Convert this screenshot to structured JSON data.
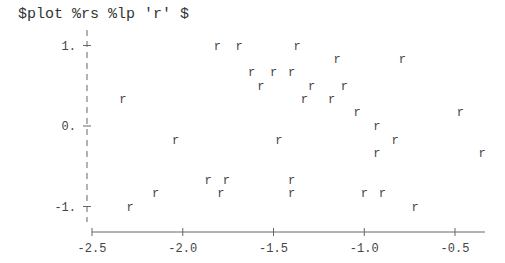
{
  "command": "$plot %rs %lp 'r' $",
  "chart_data": {
    "type": "scatter",
    "title": "",
    "xlabel": "",
    "ylabel": "",
    "marker": "r",
    "grid": false,
    "xlim": [
      -2.5,
      -0.33
    ],
    "ylim": [
      -1.15,
      1.15
    ],
    "x_ticks": [
      -2.5,
      -2.0,
      -1.5,
      -1.0,
      -0.5
    ],
    "x_tick_labels": [
      "-2.5",
      "-2.0",
      "-1.5",
      "-1.0",
      "-0.5"
    ],
    "y_ticks": [
      1,
      0,
      -1
    ],
    "y_tick_labels": [
      "1.",
      "0.",
      "-1."
    ],
    "series": [
      {
        "name": "r",
        "x": [
          -2.33,
          -1.81,
          -2.29,
          -2.15,
          -2.04,
          -1.86,
          -1.79,
          -1.76,
          -1.69,
          -1.62,
          -1.57,
          -1.5,
          -1.47,
          -1.4,
          -1.4,
          -1.4,
          -1.37,
          -1.33,
          -1.29,
          -1.18,
          -1.15,
          -1.11,
          -1.04,
          -1.0,
          -0.93,
          -0.93,
          -0.9,
          -0.83,
          -0.79,
          -0.72,
          -0.47,
          -0.35
        ],
        "y": [
          0.33,
          1.0,
          -1.0,
          -0.83,
          -0.17,
          -0.67,
          -0.83,
          -0.67,
          1.0,
          0.67,
          0.5,
          0.67,
          -0.17,
          0.67,
          -0.67,
          -0.83,
          1.0,
          0.33,
          0.5,
          0.33,
          0.83,
          0.5,
          0.17,
          -0.83,
          0.0,
          -0.33,
          -0.83,
          -0.17,
          0.83,
          -1.0,
          0.17,
          -0.33
        ]
      }
    ]
  }
}
